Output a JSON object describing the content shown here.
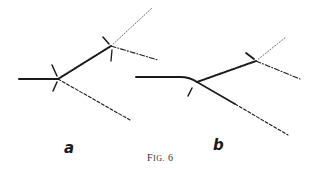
{
  "figure": {
    "caption_prefix": "F",
    "caption_smallcaps": "IG.",
    "caption_number": "6",
    "panels": [
      {
        "label": "a",
        "description": "Branching paths with two nodes marked by tick arrows; solid incoming line, thick dotted segment between nodes, fine dotted, dash-dot and dashed outgoing branches"
      },
      {
        "label": "b",
        "description": "Curved solid incoming line meeting a branch point; thick dotted segment to second node, fine dotted and dash-dot branches, solid-then-dashed lower branch"
      }
    ]
  },
  "colors": {
    "ink": "#1a1a1a",
    "background": "#ffffff"
  }
}
